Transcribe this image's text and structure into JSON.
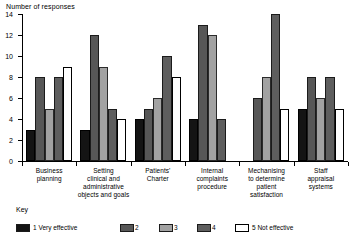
{
  "chart_data": {
    "type": "bar",
    "title": "",
    "ylabel": "Number of responses",
    "xlabel": "",
    "ylim": [
      0,
      14
    ],
    "yticks": [
      0,
      2,
      4,
      6,
      8,
      10,
      12,
      14
    ],
    "grid": false,
    "legend_position": "bottom",
    "legend_title": "Key",
    "categories": [
      "Business planning",
      "Setting clinical and administrative objects and goals",
      "Patients' Charter",
      "Internal complaints procedure",
      "Mechanising to determine patient satisfaction",
      "Staff appraisal systems"
    ],
    "category_lines": [
      [
        "Business",
        "planning"
      ],
      [
        "Setting",
        "clinical and",
        "administrative",
        "objects and goals"
      ],
      [
        "Patients'",
        "Charter"
      ],
      [
        "Internal",
        "complaints",
        "procedure"
      ],
      [
        "Mechanising",
        "to determine",
        "patient",
        "satisfaction"
      ],
      [
        "Staff",
        "appraisal",
        "systems"
      ]
    ],
    "series": [
      {
        "name": "1 Very effective",
        "key": "1",
        "color": "#141414",
        "values": [
          3,
          3,
          4,
          4,
          0,
          5
        ]
      },
      {
        "name": "2",
        "key": "2",
        "color": "#575757",
        "values": [
          8,
          12,
          5,
          13,
          6,
          8
        ]
      },
      {
        "name": "3",
        "key": "3",
        "color": "#a2a2a2",
        "values": [
          5,
          9,
          6,
          12,
          8,
          6
        ]
      },
      {
        "name": "4",
        "key": "4",
        "color": "#5e5e5e",
        "values": [
          8,
          5,
          10,
          4,
          14,
          8
        ]
      },
      {
        "name": "5 Not effective",
        "key": "5",
        "color": "#ffffff",
        "values": [
          9,
          4,
          8,
          0,
          5,
          5
        ]
      }
    ],
    "legend_entries": [
      {
        "label": "1 Very effective",
        "color": "#141414"
      },
      {
        "label": "2",
        "color": "#575757"
      },
      {
        "label": "3",
        "color": "#a2a2a2"
      },
      {
        "label": "4",
        "color": "#5e5e5e"
      },
      {
        "label": "5 Not effective",
        "color": "#ffffff"
      }
    ]
  }
}
